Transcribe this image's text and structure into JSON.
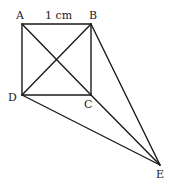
{
  "diagram": {
    "points": {
      "A": {
        "label": "A",
        "x": 22,
        "y": 24
      },
      "B": {
        "label": "B",
        "x": 91,
        "y": 24
      },
      "C": {
        "label": "C",
        "x": 91,
        "y": 95
      },
      "D": {
        "label": "D",
        "x": 22,
        "y": 95
      },
      "E": {
        "label": "E",
        "x": 160,
        "y": 165
      }
    },
    "side_label": "1 cm",
    "segments": [
      "AB",
      "BC",
      "CD",
      "DA",
      "AC",
      "BD",
      "CE",
      "BE",
      "DE"
    ]
  }
}
